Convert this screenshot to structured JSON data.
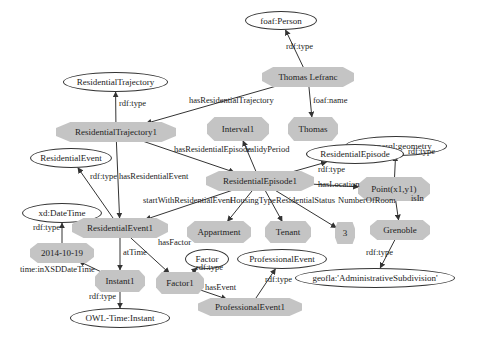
{
  "diagram": {
    "nodes": [
      {
        "id": "n0",
        "label": "foaf:Person",
        "shape": "ellipse",
        "x": 245,
        "y": 11,
        "w": 72,
        "h": 19
      },
      {
        "id": "n1",
        "label": "Thomas Lefranc",
        "shape": "oct",
        "x": 262,
        "y": 67,
        "w": 92,
        "h": 20
      },
      {
        "id": "n2",
        "label": "ResidentialTrajectory",
        "shape": "ellipse",
        "x": 63,
        "y": 72,
        "w": 105,
        "h": 20
      },
      {
        "id": "n3",
        "label": "ResidentialTrajectory1",
        "shape": "oct",
        "x": 56,
        "y": 122,
        "w": 120,
        "h": 20
      },
      {
        "id": "n4",
        "label": "Interval1",
        "shape": "oct",
        "x": 207,
        "y": 117,
        "w": 62,
        "h": 24
      },
      {
        "id": "n5",
        "label": "Thomas",
        "shape": "oct",
        "x": 288,
        "y": 117,
        "w": 50,
        "h": 24
      },
      {
        "id": "n6",
        "label": "geosparql:geometry",
        "shape": "ellipse",
        "x": 345,
        "y": 136,
        "w": 102,
        "h": 20
      },
      {
        "id": "n7",
        "label": "ResidentialEvent",
        "shape": "ellipse",
        "x": 30,
        "y": 148,
        "w": 82,
        "h": 20
      },
      {
        "id": "n8",
        "label": "ResidentialEpisode",
        "shape": "ellipse",
        "x": 306,
        "y": 144,
        "w": 98,
        "h": 20
      },
      {
        "id": "n9",
        "label": "ResidentialEpisode1",
        "shape": "oct",
        "x": 206,
        "y": 171,
        "w": 108,
        "h": 20
      },
      {
        "id": "n10",
        "label": "Point(x1,y1)",
        "shape": "oct",
        "x": 358,
        "y": 177,
        "w": 72,
        "h": 24
      },
      {
        "id": "n11",
        "label": "xd:DateTime",
        "shape": "ellipse",
        "x": 22,
        "y": 203,
        "w": 80,
        "h": 20
      },
      {
        "id": "n12",
        "label": "ResidentialEvent1",
        "shape": "oct",
        "x": 72,
        "y": 218,
        "w": 96,
        "h": 20
      },
      {
        "id": "n13",
        "label": "Appartment",
        "shape": "oct",
        "x": 187,
        "y": 221,
        "w": 64,
        "h": 22
      },
      {
        "id": "n14",
        "label": "Tenant",
        "shape": "oct",
        "x": 265,
        "y": 221,
        "w": 46,
        "h": 22
      },
      {
        "id": "n15",
        "label": "3",
        "shape": "oct",
        "x": 335,
        "y": 222,
        "w": 20,
        "h": 22
      },
      {
        "id": "n16",
        "label": "Grenoble",
        "shape": "oct",
        "x": 370,
        "y": 220,
        "w": 60,
        "h": 20
      },
      {
        "id": "n17",
        "label": "2014-10-19",
        "shape": "oct",
        "x": 30,
        "y": 243,
        "w": 64,
        "h": 20
      },
      {
        "id": "n18",
        "label": "Factor",
        "shape": "ellipse",
        "x": 185,
        "y": 249,
        "w": 44,
        "h": 20
      },
      {
        "id": "n19",
        "label": "ProfessionalEvent",
        "shape": "ellipse",
        "x": 237,
        "y": 249,
        "w": 90,
        "h": 20
      },
      {
        "id": "n20",
        "label": "Instant1",
        "shape": "oct",
        "x": 95,
        "y": 270,
        "w": 50,
        "h": 22
      },
      {
        "id": "n21",
        "label": "Factor1",
        "shape": "oct",
        "x": 156,
        "y": 272,
        "w": 48,
        "h": 22
      },
      {
        "id": "n22",
        "label": "geofla:'AdministrativeSubdivision'",
        "shape": "ellipse",
        "x": 295,
        "y": 268,
        "w": 160,
        "h": 20
      },
      {
        "id": "n23",
        "label": "ProfessionalEvent1",
        "shape": "oct",
        "x": 198,
        "y": 298,
        "w": 104,
        "h": 18
      },
      {
        "id": "n24",
        "label": "OWL-Time:Instant",
        "shape": "ellipse",
        "x": 70,
        "y": 308,
        "w": 100,
        "h": 20
      }
    ],
    "edges": [
      {
        "from": "n1",
        "to": "n0",
        "label": "rdf:type",
        "lx": 286,
        "ly": 47
      },
      {
        "from": "n1",
        "to": "n3",
        "label": "hasResidentialTrajectory",
        "lx": 189,
        "ly": 101
      },
      {
        "from": "n1",
        "to": "n5",
        "label": "foaf:name",
        "lx": 313,
        "ly": 101
      },
      {
        "from": "n3",
        "to": "n2",
        "label": "rdf:type",
        "lx": 119,
        "ly": 104
      },
      {
        "from": "n3",
        "to": "n9",
        "label": "hasResidentialEpisode",
        "lx": 174,
        "ly": 150
      },
      {
        "from": "n9",
        "to": "n4",
        "label": "validyPeriod",
        "lx": 246,
        "ly": 150
      },
      {
        "from": "n9",
        "to": "n8",
        "label": "rdf:type",
        "lx": 318,
        "ly": 170
      },
      {
        "from": "n9",
        "to": "n10",
        "label": "hasLocation",
        "lx": 318,
        "ly": 185
      },
      {
        "from": "n10",
        "to": "n6",
        "label": "rdf:type",
        "lx": 408,
        "ly": 152
      },
      {
        "from": "n10",
        "to": "n16",
        "label": "isIn",
        "lx": 411,
        "ly": 199
      },
      {
        "from": "n16",
        "to": "n22",
        "label": "rdf:type",
        "lx": 366,
        "ly": 253
      },
      {
        "from": "n3",
        "to": "n12",
        "label": "hasResidentialEvent",
        "lx": 119,
        "ly": 177
      },
      {
        "from": "n12",
        "to": "n7",
        "label": "rdf:type",
        "lx": 90,
        "ly": 177
      },
      {
        "from": "n9",
        "to": "n12",
        "label": "startWithResidentialEvent",
        "lx": 143,
        "ly": 201
      },
      {
        "from": "n9",
        "to": "n13",
        "label": "HousingType",
        "lx": 230,
        "ly": 201
      },
      {
        "from": "n9",
        "to": "n14",
        "label": "ResidentialStatus",
        "lx": 276,
        "ly": 201
      },
      {
        "from": "n9",
        "to": "n15",
        "label": "NumberOfRoom",
        "lx": 338,
        "ly": 201
      },
      {
        "from": "n17",
        "to": "n11",
        "label": "rdf:type",
        "lx": 33,
        "ly": 228
      },
      {
        "from": "n12",
        "to": "n20",
        "label": "atTime",
        "lx": 123,
        "ly": 253
      },
      {
        "from": "n12",
        "to": "n21",
        "label": "hasFactor",
        "lx": 158,
        "ly": 243
      },
      {
        "from": "n20",
        "to": "n17",
        "label": "time:inXSDDateTime",
        "lx": 20,
        "ly": 270
      },
      {
        "from": "n20",
        "to": "n24",
        "label": "rdf:type",
        "lx": 89,
        "ly": 297
      },
      {
        "from": "n21",
        "to": "n18",
        "label": "rdf:type",
        "lx": 196,
        "ly": 268
      },
      {
        "from": "n21",
        "to": "n23",
        "label": "hasEvent",
        "lx": 205,
        "ly": 288
      },
      {
        "from": "n23",
        "to": "n19",
        "label": "rdf:type",
        "lx": 265,
        "ly": 280
      }
    ]
  },
  "colors": {
    "node_fill": "#c4c4c4",
    "edge": "#333333",
    "ellipse_border": "#333333"
  }
}
